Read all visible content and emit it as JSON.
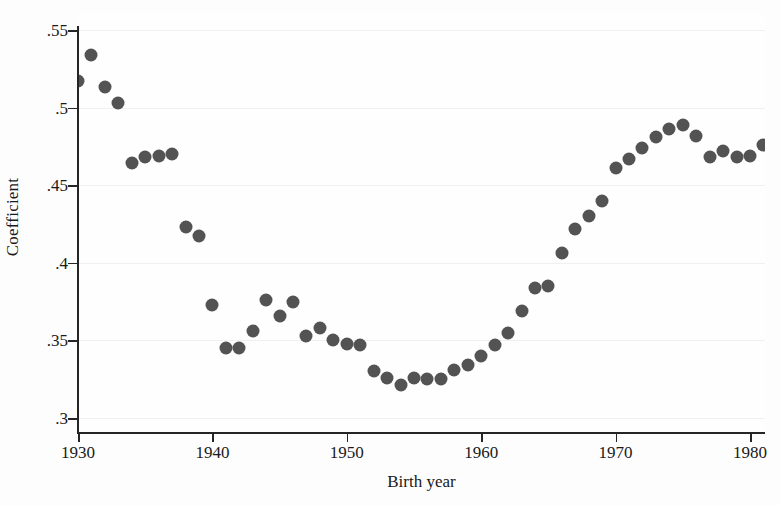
{
  "chart_data": {
    "type": "scatter",
    "title": "",
    "xlabel": "Birth year",
    "ylabel": "Coefficient",
    "xlim": [
      1929,
      1982
    ],
    "ylim": [
      0.3,
      0.55
    ],
    "xticks": [
      1930,
      1940,
      1950,
      1960,
      1970,
      1980
    ],
    "xtick_labels": [
      "1930",
      "1940",
      "1950",
      "1960",
      "1970",
      "1980"
    ],
    "yticks": [
      0.3,
      0.35,
      0.4,
      0.45,
      0.5,
      0.55
    ],
    "ytick_labels": [
      ".3",
      ".35",
      ".4",
      ".45",
      ".5",
      ".55"
    ],
    "grid": true,
    "grid_axis": "y",
    "legend": null,
    "marker": "filled-circle",
    "marker_color": "#535353",
    "marker_size": 13,
    "x": [
      1930,
      1931,
      1932,
      1933,
      1934,
      1935,
      1936,
      1937,
      1938,
      1939,
      1940,
      1941,
      1942,
      1943,
      1944,
      1945,
      1946,
      1947,
      1948,
      1949,
      1950,
      1951,
      1952,
      1953,
      1954,
      1955,
      1956,
      1957,
      1958,
      1959,
      1960,
      1961,
      1962,
      1963,
      1964,
      1965,
      1966,
      1967,
      1968,
      1969,
      1970,
      1971,
      1972,
      1973,
      1974,
      1975,
      1976,
      1977,
      1978,
      1979,
      1980,
      1981
    ],
    "y": [
      0.517,
      0.534,
      0.513,
      0.503,
      0.464,
      0.468,
      0.469,
      0.47,
      0.423,
      0.417,
      0.373,
      0.345,
      0.345,
      0.356,
      0.376,
      0.366,
      0.375,
      0.353,
      0.358,
      0.35,
      0.348,
      0.347,
      0.33,
      0.326,
      0.321,
      0.326,
      0.325,
      0.325,
      0.331,
      0.334,
      0.34,
      0.347,
      0.355,
      0.369,
      0.384,
      0.385,
      0.406,
      0.422,
      0.43,
      0.44,
      0.461,
      0.467,
      0.474,
      0.481,
      0.486,
      0.489,
      0.482,
      0.468,
      0.472,
      0.468,
      0.469,
      0.476
    ],
    "series_name": "Coefficient by birth year"
  },
  "axes": {
    "y_title": "Coefficient",
    "x_title": "Birth year"
  }
}
